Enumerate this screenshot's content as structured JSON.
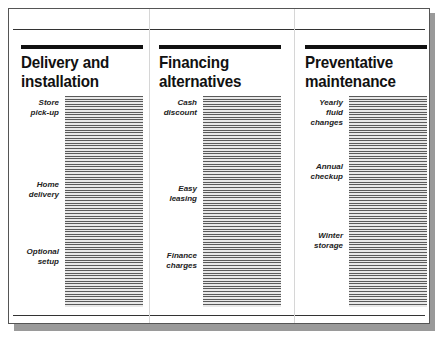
{
  "columns": [
    {
      "title_line1": "Delivery and",
      "title_line2": "installation",
      "items": [
        {
          "line1": "Store",
          "line2": "pick-up"
        },
        {
          "line1": "Home",
          "line2": "delivery"
        },
        {
          "line1": "Optional",
          "line2": "setup"
        }
      ]
    },
    {
      "title_line1": "Financing",
      "title_line2": "alternatives",
      "items": [
        {
          "line1": "Cash",
          "line2": "discount"
        },
        {
          "line1": "Easy",
          "line2": "leasing"
        },
        {
          "line1": "Finance",
          "line2": "charges"
        }
      ]
    },
    {
      "title_line1": "Preventative",
      "title_line2": "maintenance",
      "items": [
        {
          "line1": "Yearly",
          "line2": "fluid",
          "line3": "changes"
        },
        {
          "line1": "Annual",
          "line2": "checkup"
        },
        {
          "line1": "Winter",
          "line2": "storage"
        }
      ]
    }
  ]
}
